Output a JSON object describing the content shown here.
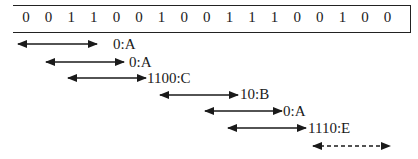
{
  "bit_sequence": [
    "0",
    "0",
    "1",
    "1",
    "0",
    "0",
    "1",
    "0",
    "0",
    "1",
    "1",
    "1",
    "0",
    "0",
    "1",
    "0",
    "0"
  ],
  "parses": [
    {
      "label": "0:A",
      "x1": 18,
      "x2": 97,
      "y": 44,
      "lx": 113,
      "ly": 36,
      "dashed": false
    },
    {
      "label": "0:A",
      "x1": 46,
      "x2": 124,
      "y": 62,
      "lx": 129,
      "ly": 54,
      "dashed": false
    },
    {
      "label": "1100:C",
      "x1": 68,
      "x2": 146,
      "y": 78,
      "lx": 147,
      "ly": 70,
      "dashed": false
    },
    {
      "label": "10:B",
      "x1": 160,
      "x2": 238,
      "y": 95,
      "lx": 240,
      "ly": 86,
      "dashed": false
    },
    {
      "label": "0:A",
      "x1": 205,
      "x2": 282,
      "y": 111,
      "lx": 283,
      "ly": 103,
      "dashed": false
    },
    {
      "label": "1110:E",
      "x1": 228,
      "x2": 306,
      "y": 128,
      "lx": 308,
      "ly": 120,
      "dashed": false
    },
    {
      "label": "",
      "x1": 313,
      "x2": 390,
      "y": 146,
      "lx": 0,
      "ly": 0,
      "dashed": true
    }
  ]
}
